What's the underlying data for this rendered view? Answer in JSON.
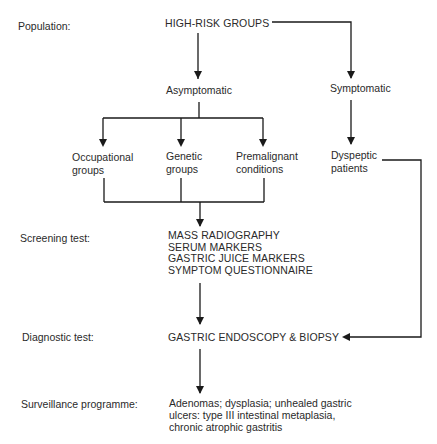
{
  "stage_labels": {
    "population": "Population:",
    "screening": "Screening test:",
    "diagnostic": "Diagnostic test:",
    "surveillance": "Surveillance programme:"
  },
  "nodes": {
    "high_risk": "HIGH-RISK GROUPS",
    "asymptomatic": "Asymptomatic",
    "symptomatic": "Symptomatic",
    "occupational": [
      "Occupational",
      "groups"
    ],
    "genetic": [
      "Genetic",
      "groups"
    ],
    "premalignant": [
      "Premalignant",
      "conditions"
    ],
    "dyspeptic": [
      "Dyspeptic",
      "patients"
    ],
    "screening_tests": [
      "MASS RADIOGRAPHY",
      "SERUM MARKERS",
      "GASTRIC JUICE MARKERS",
      "SYMPTOM QUESTIONNAIRE"
    ],
    "diagnostic": "GASTRIC ENDOSCOPY & BIOPSY",
    "surveillance": [
      "Adenomas; dysplasia; unhealed gastric",
      "ulcers: type III intestinal metaplasia,",
      "chronic atrophic gastritis"
    ]
  },
  "colors": {
    "line": "#1a1a1a",
    "text": "#2a2a2a",
    "background": "#ffffff"
  }
}
